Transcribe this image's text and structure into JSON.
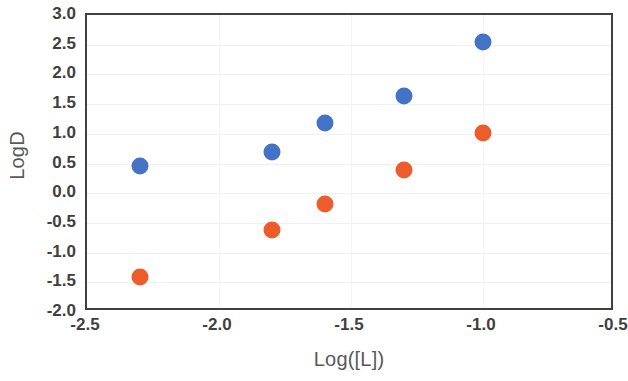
{
  "chart_data": {
    "type": "scatter",
    "title": "",
    "subtitle": "",
    "xlabel": "Log([L])",
    "ylabel": "LogD",
    "xlim": [
      -2.5,
      -0.5
    ],
    "ylim": [
      -2.0,
      3.0
    ],
    "xticks": [
      "-2.5",
      "-2.0",
      "-1.5",
      "-1.0",
      "-0.5"
    ],
    "xtick_values": [
      -2.5,
      -2.0,
      -1.5,
      -1.0,
      -0.5
    ],
    "yticks": [
      "3.0",
      "2.5",
      "2.0",
      "1.5",
      "1.0",
      "0.5",
      "0.0",
      "-0.5",
      "-1.0",
      "-1.5",
      "-2.0"
    ],
    "ytick_values": [
      3.0,
      2.5,
      2.0,
      1.5,
      1.0,
      0.5,
      0.0,
      -0.5,
      -1.0,
      -1.5,
      -2.0
    ],
    "grid": true,
    "grid_axis": "both",
    "legend": false,
    "legend_position": "none",
    "annotations": [],
    "series": [
      {
        "name": "series-blue",
        "color": "#4472C4",
        "marker": "circle",
        "x": [
          -2.3,
          -1.8,
          -1.6,
          -1.3,
          -1.0
        ],
        "y": [
          0.46,
          0.69,
          1.18,
          1.63,
          2.55
        ],
        "points": [
          {
            "x": -2.3,
            "y": 0.46
          },
          {
            "x": -1.8,
            "y": 0.69
          },
          {
            "x": -1.6,
            "y": 1.18
          },
          {
            "x": -1.3,
            "y": 1.63
          },
          {
            "x": -1.0,
            "y": 2.55
          }
        ]
      },
      {
        "name": "series-orange",
        "color": "#ED5C2B",
        "marker": "circle",
        "x": [
          -2.3,
          -1.8,
          -1.6,
          -1.3,
          -1.0
        ],
        "y": [
          -1.41,
          -0.62,
          -0.18,
          0.39,
          1.01
        ],
        "points": [
          {
            "x": -2.3,
            "y": -1.41
          },
          {
            "x": -1.8,
            "y": -0.62
          },
          {
            "x": -1.6,
            "y": -0.18
          },
          {
            "x": -1.3,
            "y": 0.39
          },
          {
            "x": -1.0,
            "y": 1.01
          }
        ]
      }
    ]
  },
  "style": {
    "axis_line_color": "#404040",
    "gridline_color": "#f0f0f0",
    "tick_label_color": "#404040",
    "axis_title_color": "#595959",
    "plot_background": "#ffffff"
  }
}
